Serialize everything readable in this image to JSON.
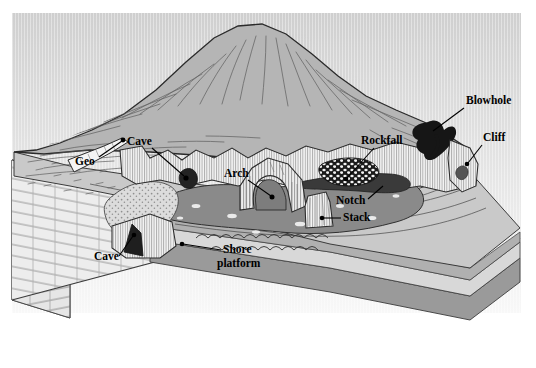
{
  "figure": {
    "type": "block-diagram",
    "background_color": "#ffffff",
    "sky_color_top": "#d2d2d2",
    "sky_color_bottom": "#f7f7f7",
    "headland_color": "#b5b5b5",
    "platform_color": "#c9c9c9",
    "sea_color": "#8a8a8a",
    "cliff_color": "#f2f2f2",
    "rock_dark_color": "#2f2f2f",
    "stratum_dark_color": "#9a9a9a",
    "stratum_light_color": "#d8d8d8",
    "line_color": "#2b2b2b"
  },
  "labels": [
    {
      "id": "geo",
      "text": "Geo",
      "x": 75,
      "y": 165,
      "anchor": "start",
      "leader": {
        "x1": 99,
        "y1": 157,
        "x2": 122,
        "y2": 141
      },
      "dot": {
        "x": 123,
        "y": 140
      }
    },
    {
      "id": "cave-upper",
      "text": "Cave",
      "x": 127,
      "y": 145,
      "anchor": "start",
      "leader": {
        "x1": 152,
        "y1": 148,
        "x2": 184,
        "y2": 176
      },
      "dot": {
        "x": 186,
        "y": 178
      }
    },
    {
      "id": "arch",
      "text": "Arch",
      "x": 224,
      "y": 177,
      "anchor": "start",
      "leader": {
        "x1": 248,
        "y1": 180,
        "x2": 271,
        "y2": 196
      },
      "dot": {
        "x": 272,
        "y": 197
      }
    },
    {
      "id": "rockfall",
      "text": "Rockfall",
      "x": 361,
      "y": 144,
      "anchor": "start",
      "leader": {
        "x1": 374,
        "y1": 148,
        "x2": 347,
        "y2": 178
      },
      "dot": {
        "x": 346,
        "y": 179
      }
    },
    {
      "id": "blowhole",
      "text": "Blowhole",
      "x": 466,
      "y": 104,
      "anchor": "start",
      "leader": {
        "x1": 464,
        "y1": 108,
        "x2": 433,
        "y2": 131
      },
      "dot": null
    },
    {
      "id": "cliff",
      "text": "Cliff",
      "x": 483,
      "y": 141,
      "anchor": "start",
      "leader": {
        "x1": 482,
        "y1": 145,
        "x2": 468,
        "y2": 163
      },
      "dot": {
        "x": 467,
        "y": 164
      }
    },
    {
      "id": "notch",
      "text": "Notch",
      "x": 336,
      "y": 204,
      "anchor": "start",
      "leader": {
        "x1": 368,
        "y1": 199,
        "x2": 383,
        "y2": 186
      },
      "dot": null
    },
    {
      "id": "stack",
      "text": "Stack",
      "x": 343,
      "y": 221,
      "anchor": "start",
      "leader": {
        "x1": 341,
        "y1": 218,
        "x2": 323,
        "y2": 218
      },
      "dot": {
        "x": 322,
        "y": 218
      }
    },
    {
      "id": "shore-platform-line1",
      "text": "Shore",
      "x": 223,
      "y": 253,
      "anchor": "start",
      "leader": {
        "x1": 221,
        "y1": 250,
        "x2": 183,
        "y2": 244
      },
      "dot": {
        "x": 182,
        "y": 244
      }
    },
    {
      "id": "shore-platform-line2",
      "text": "platform",
      "x": 217,
      "y": 267,
      "anchor": "start",
      "leader": null,
      "dot": null
    },
    {
      "id": "cave-lower",
      "text": "Cave",
      "x": 94,
      "y": 260,
      "anchor": "start",
      "leader": {
        "x1": 119,
        "y1": 256,
        "x2": 133,
        "y2": 236
      },
      "dot": {
        "x": 134,
        "y": 235
      }
    }
  ]
}
